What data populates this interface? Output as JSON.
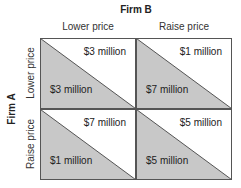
{
  "diagram": {
    "type": "payoff-matrix",
    "column_player": "Firm B",
    "row_player": "Firm A",
    "column_strategies": [
      "Lower price",
      "Raise price"
    ],
    "row_strategies": [
      "Lower price",
      "Raise price"
    ],
    "cells": [
      {
        "row": "Lower price",
        "col": "Lower price",
        "firm_b_payoff": "$3 million",
        "firm_a_payoff": "$3 million"
      },
      {
        "row": "Lower price",
        "col": "Raise price",
        "firm_b_payoff": "$1 million",
        "firm_a_payoff": "$7 million"
      },
      {
        "row": "Raise price",
        "col": "Lower price",
        "firm_b_payoff": "$7 million",
        "firm_a_payoff": "$1 million"
      },
      {
        "row": "Raise price",
        "col": "Raise price",
        "firm_b_payoff": "$5 million",
        "firm_a_payoff": "$5 million"
      }
    ],
    "colors": {
      "shaded_triangle": "#c8c8c8",
      "border": "#555555",
      "cell_background": "#ffffff"
    }
  }
}
